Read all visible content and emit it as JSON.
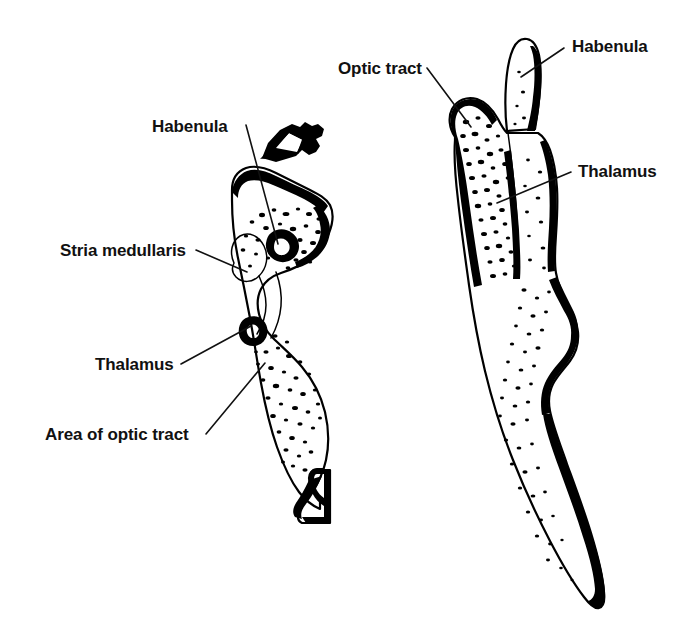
{
  "figure": {
    "background_color": "#ffffff",
    "ink_color": "#000000",
    "label_color": "#111111",
    "width": 687,
    "height": 626
  },
  "specimens": [
    {
      "id": "left-specimen",
      "name": "left-specimen",
      "description": "Medial view of thalamus showing habenula, stria medullaris, thalamus and area of optic tract"
    },
    {
      "id": "right-specimen",
      "name": "right-specimen",
      "description": "Lateral view of thalamus showing optic tract, habenula and thalamus"
    }
  ],
  "labels": [
    {
      "id": "habenula-left",
      "text": "Habenula",
      "x": 152,
      "y": 132,
      "anchor": "start",
      "specimen": "left-specimen"
    },
    {
      "id": "stria-medullaris",
      "text": "Stria medullaris",
      "x": 60,
      "y": 256,
      "anchor": "start",
      "specimen": "left-specimen"
    },
    {
      "id": "thalamus-left",
      "text": "Thalamus",
      "x": 95,
      "y": 370,
      "anchor": "start",
      "specimen": "left-specimen"
    },
    {
      "id": "area-of-optic-tract",
      "text": "Area of optic tract",
      "x": 45,
      "y": 440,
      "anchor": "start",
      "specimen": "left-specimen"
    },
    {
      "id": "optic-tract",
      "text": "Optic tract",
      "x": 338,
      "y": 74,
      "anchor": "start",
      "specimen": "right-specimen"
    },
    {
      "id": "habenula-right",
      "text": "Habenula",
      "x": 572,
      "y": 52,
      "anchor": "start",
      "specimen": "right-specimen"
    },
    {
      "id": "thalamus-right",
      "text": "Thalamus",
      "x": 578,
      "y": 177,
      "anchor": "start",
      "specimen": "right-specimen"
    }
  ]
}
